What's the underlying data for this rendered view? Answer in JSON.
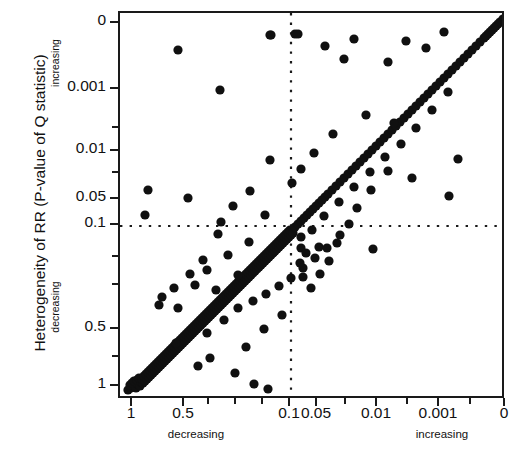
{
  "chart_data": {
    "type": "scatter",
    "title": "",
    "xlabel": "",
    "ylabel": "Heterogeneity of RR (P-value of Q statistic)",
    "x_axis": {
      "tick_labels": [
        "1",
        "0.5",
        "0.1",
        "0.05",
        "0.01",
        "0.001",
        "0"
      ],
      "tick_values": [
        1,
        0.5,
        0.1,
        0.05,
        0.01,
        0.001,
        0
      ],
      "tick_px": [
        131,
        183,
        289,
        316,
        376,
        438,
        504
      ],
      "minor_tick_px": [
        208,
        235,
        262,
        345,
        407,
        470
      ],
      "direction_left_word": "decreasing",
      "direction_right_word": "increasing",
      "direction_left_px": 196,
      "direction_right_px": 442
    },
    "y_axis": {
      "tick_labels": [
        "0",
        "0.001",
        "0.01",
        "0.05",
        "0.1",
        "0.5",
        "1"
      ],
      "tick_values": [
        0,
        0.001,
        0.01,
        0.05,
        0.1,
        0.5,
        1
      ],
      "tick_px": [
        22,
        88,
        150,
        198,
        224,
        328,
        385
      ],
      "minor_tick_px": [
        127,
        172,
        256,
        284,
        356
      ],
      "direction_top_word": "increasing",
      "direction_bottom_word": "decreasing"
    },
    "reference_lines": [
      {
        "orientation": "horizontal",
        "value": 0.1,
        "px": 224,
        "style": "dotted"
      },
      {
        "orientation": "vertical",
        "value": 0.1,
        "px": 289,
        "style": "dotted"
      }
    ],
    "identity_line": {
      "style": "solid",
      "from_px": [
        131,
        385
      ],
      "to_px": [
        504,
        14
      ]
    },
    "grid": false,
    "legend": null,
    "marker": {
      "shape": "circle",
      "color": "#101010",
      "radius_px": 4.6
    },
    "n_points": 268,
    "points_px": [
      [
        126,
        388
      ],
      [
        129,
        386
      ],
      [
        131,
        384
      ],
      [
        133,
        383
      ],
      [
        128,
        383
      ],
      [
        134,
        386
      ],
      [
        130,
        381
      ],
      [
        136,
        382
      ],
      [
        132,
        379
      ],
      [
        138,
        384
      ],
      [
        135,
        378
      ],
      [
        139,
        380
      ],
      [
        137,
        376
      ],
      [
        141,
        381
      ],
      [
        140,
        377
      ],
      [
        143,
        379
      ],
      [
        142,
        374
      ],
      [
        145,
        377
      ],
      [
        144,
        372
      ],
      [
        147,
        375
      ],
      [
        146,
        370
      ],
      [
        149,
        373
      ],
      [
        148,
        368
      ],
      [
        151,
        371
      ],
      [
        150,
        366
      ],
      [
        153,
        369
      ],
      [
        152,
        364
      ],
      [
        155,
        367
      ],
      [
        154,
        362
      ],
      [
        157,
        365
      ],
      [
        156,
        360
      ],
      [
        159,
        363
      ],
      [
        158,
        358
      ],
      [
        161,
        361
      ],
      [
        160,
        356
      ],
      [
        163,
        359
      ],
      [
        162,
        354
      ],
      [
        165,
        357
      ],
      [
        164,
        352
      ],
      [
        167,
        355
      ],
      [
        166,
        350
      ],
      [
        169,
        353
      ],
      [
        168,
        348
      ],
      [
        171,
        351
      ],
      [
        170,
        346
      ],
      [
        173,
        349
      ],
      [
        172,
        344
      ],
      [
        175,
        347
      ],
      [
        174,
        342
      ],
      [
        177,
        345
      ],
      [
        176,
        340
      ],
      [
        179,
        343
      ],
      [
        178,
        338
      ],
      [
        181,
        341
      ],
      [
        180,
        336
      ],
      [
        183,
        339
      ],
      [
        182,
        334
      ],
      [
        185,
        337
      ],
      [
        184,
        332
      ],
      [
        187,
        335
      ],
      [
        186,
        330
      ],
      [
        189,
        333
      ],
      [
        188,
        328
      ],
      [
        191,
        331
      ],
      [
        190,
        326
      ],
      [
        193,
        329
      ],
      [
        192,
        324
      ],
      [
        195,
        327
      ],
      [
        194,
        322
      ],
      [
        197,
        325
      ],
      [
        196,
        320
      ],
      [
        199,
        323
      ],
      [
        198,
        318
      ],
      [
        201,
        321
      ],
      [
        200,
        316
      ],
      [
        203,
        319
      ],
      [
        202,
        314
      ],
      [
        205,
        317
      ],
      [
        204,
        312
      ],
      [
        207,
        315
      ],
      [
        206,
        310
      ],
      [
        209,
        313
      ],
      [
        208,
        308
      ],
      [
        211,
        311
      ],
      [
        210,
        306
      ],
      [
        213,
        309
      ],
      [
        212,
        304
      ],
      [
        215,
        307
      ],
      [
        214,
        302
      ],
      [
        217,
        305
      ],
      [
        216,
        300
      ],
      [
        219,
        303
      ],
      [
        218,
        298
      ],
      [
        221,
        301
      ],
      [
        220,
        296
      ],
      [
        223,
        299
      ],
      [
        222,
        294
      ],
      [
        225,
        297
      ],
      [
        224,
        292
      ],
      [
        227,
        295
      ],
      [
        226,
        290
      ],
      [
        229,
        293
      ],
      [
        228,
        288
      ],
      [
        231,
        291
      ],
      [
        230,
        286
      ],
      [
        233,
        289
      ],
      [
        232,
        284
      ],
      [
        235,
        287
      ],
      [
        234,
        282
      ],
      [
        237,
        285
      ],
      [
        236,
        280
      ],
      [
        239,
        283
      ],
      [
        238,
        278
      ],
      [
        241,
        281
      ],
      [
        240,
        276
      ],
      [
        243,
        279
      ],
      [
        242,
        274
      ],
      [
        245,
        277
      ],
      [
        244,
        272
      ],
      [
        247,
        275
      ],
      [
        246,
        270
      ],
      [
        249,
        273
      ],
      [
        248,
        268
      ],
      [
        251,
        271
      ],
      [
        250,
        266
      ],
      [
        253,
        269
      ],
      [
        252,
        264
      ],
      [
        255,
        267
      ],
      [
        254,
        262
      ],
      [
        257,
        265
      ],
      [
        256,
        260
      ],
      [
        259,
        263
      ],
      [
        258,
        258
      ],
      [
        261,
        261
      ],
      [
        260,
        256
      ],
      [
        263,
        259
      ],
      [
        262,
        254
      ],
      [
        265,
        257
      ],
      [
        264,
        252
      ],
      [
        267,
        255
      ],
      [
        266,
        250
      ],
      [
        269,
        253
      ],
      [
        268,
        248
      ],
      [
        271,
        251
      ],
      [
        270,
        246
      ],
      [
        273,
        249
      ],
      [
        272,
        244
      ],
      [
        275,
        247
      ],
      [
        274,
        242
      ],
      [
        277,
        245
      ],
      [
        276,
        240
      ],
      [
        279,
        243
      ],
      [
        278,
        238
      ],
      [
        281,
        241
      ],
      [
        280,
        236
      ],
      [
        283,
        239
      ],
      [
        282,
        234
      ],
      [
        285,
        237
      ],
      [
        284,
        232
      ],
      [
        287,
        235
      ],
      [
        286,
        230
      ],
      [
        289,
        233
      ],
      [
        288,
        228
      ],
      [
        291,
        231
      ],
      [
        293,
        225
      ],
      [
        296,
        222
      ],
      [
        299,
        219
      ],
      [
        302,
        216
      ],
      [
        305,
        213
      ],
      [
        308,
        210
      ],
      [
        311,
        207
      ],
      [
        314,
        204
      ],
      [
        317,
        201
      ],
      [
        320,
        198
      ],
      [
        323,
        195
      ],
      [
        326,
        192
      ],
      [
        330,
        188
      ],
      [
        334,
        184
      ],
      [
        338,
        180
      ],
      [
        342,
        176
      ],
      [
        346,
        172
      ],
      [
        350,
        168
      ],
      [
        354,
        164
      ],
      [
        358,
        160
      ],
      [
        362,
        156
      ],
      [
        366,
        152
      ],
      [
        370,
        148
      ],
      [
        374,
        144
      ],
      [
        378,
        140
      ],
      [
        382,
        136
      ],
      [
        386,
        132
      ],
      [
        390,
        128
      ],
      [
        394,
        124
      ],
      [
        398,
        120
      ],
      [
        402,
        116
      ],
      [
        406,
        112
      ],
      [
        410,
        108
      ],
      [
        414,
        104
      ],
      [
        418,
        100
      ],
      [
        422,
        96
      ],
      [
        426,
        92
      ],
      [
        430,
        88
      ],
      [
        434,
        84
      ],
      [
        438,
        80
      ],
      [
        442,
        76
      ],
      [
        446,
        72
      ],
      [
        450,
        68
      ],
      [
        454,
        64
      ],
      [
        458,
        60
      ],
      [
        462,
        56
      ],
      [
        466,
        52
      ],
      [
        470,
        48
      ],
      [
        474,
        44
      ],
      [
        478,
        40
      ],
      [
        482,
        36
      ],
      [
        486,
        32
      ],
      [
        490,
        28
      ],
      [
        494,
        24
      ],
      [
        498,
        20
      ],
      [
        501,
        17
      ],
      [
        496,
        22
      ],
      [
        492,
        26
      ],
      [
        488,
        30
      ],
      [
        484,
        34
      ],
      [
        160,
        295
      ],
      [
        176,
        306
      ],
      [
        193,
        283
      ],
      [
        205,
        268
      ],
      [
        214,
        288
      ],
      [
        226,
        253
      ],
      [
        236,
        273
      ],
      [
        247,
        240
      ],
      [
        176,
        48
      ],
      [
        218,
        88
      ],
      [
        268,
        33
      ],
      [
        269,
        33
      ],
      [
        293,
        32
      ],
      [
        296,
        32
      ],
      [
        323,
        44
      ],
      [
        342,
        57
      ],
      [
        352,
        37
      ],
      [
        386,
        60
      ],
      [
        404,
        39
      ],
      [
        424,
        46
      ],
      [
        442,
        30
      ],
      [
        446,
        90
      ],
      [
        392,
        121
      ],
      [
        364,
        113
      ],
      [
        331,
        132
      ],
      [
        312,
        151
      ],
      [
        299,
        167
      ],
      [
        290,
        181
      ],
      [
        186,
        196
      ],
      [
        146,
        188
      ],
      [
        143,
        213
      ],
      [
        219,
        220
      ],
      [
        263,
        213
      ],
      [
        299,
        235
      ],
      [
        310,
        228
      ],
      [
        317,
        245
      ],
      [
        299,
        246
      ],
      [
        304,
        251
      ],
      [
        298,
        261
      ],
      [
        301,
        275
      ],
      [
        338,
        233
      ],
      [
        371,
        247
      ],
      [
        447,
        194
      ],
      [
        456,
        157
      ],
      [
        410,
        176
      ],
      [
        386,
        169
      ],
      [
        369,
        188
      ],
      [
        355,
        206
      ],
      [
        347,
        222
      ],
      [
        335,
        241
      ],
      [
        327,
        259
      ],
      [
        318,
        272
      ],
      [
        309,
        286
      ],
      [
        280,
        313
      ],
      [
        262,
        327
      ],
      [
        244,
        345
      ],
      [
        252,
        382
      ],
      [
        266,
        387
      ],
      [
        233,
        371
      ],
      [
        208,
        356
      ],
      [
        196,
        364
      ],
      [
        174,
        341
      ],
      [
        205,
        331
      ],
      [
        222,
        318
      ],
      [
        236,
        306
      ],
      [
        251,
        299
      ],
      [
        264,
        292
      ],
      [
        277,
        284
      ],
      [
        289,
        276
      ],
      [
        301,
        266
      ],
      [
        313,
        256
      ],
      [
        325,
        246
      ],
      [
        268,
        158
      ],
      [
        248,
        189
      ],
      [
        231,
        204
      ],
      [
        216,
        232
      ],
      [
        201,
        258
      ],
      [
        188,
        272
      ],
      [
        172,
        286
      ],
      [
        157,
        303
      ],
      [
        430,
        108
      ],
      [
        414,
        126
      ],
      [
        399,
        142
      ],
      [
        383,
        155
      ],
      [
        368,
        170
      ],
      [
        352,
        185
      ],
      [
        337,
        200
      ],
      [
        322,
        214
      ]
    ]
  },
  "axis_text": {
    "y_title": "Heterogeneity of RR (P-value of Q statistic)",
    "y_increasing": "increasing",
    "y_decreasing": "decreasing",
    "x_decreasing": "decreasing",
    "x_increasing": "increasing"
  },
  "colors": {
    "marker": "#101010",
    "axis": "#1a1a1a",
    "background": "#ffffff",
    "reference_line": "#1a1a1a"
  }
}
